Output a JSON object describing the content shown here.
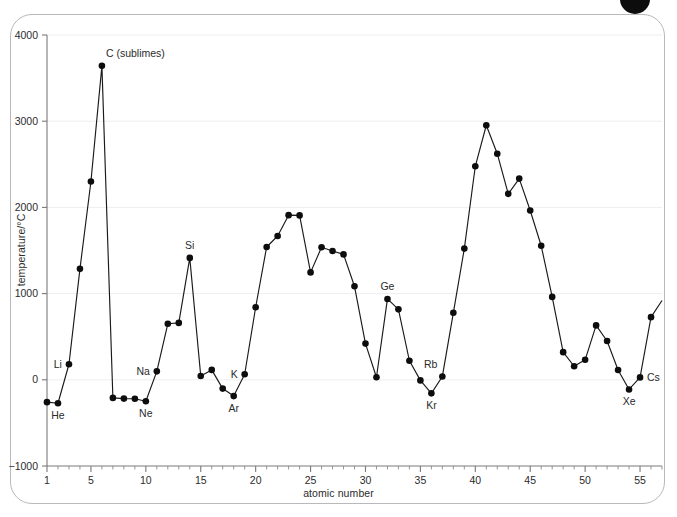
{
  "figure": {
    "frame_border_color": "#b9b9bb",
    "background_color": "#ffffff",
    "badge_color": "#0d0d0d",
    "badge_name": "page-corner-badge"
  },
  "chart_data": {
    "type": "line",
    "title": "",
    "subtitle": "",
    "xlabel": "atomic number",
    "ylabel": "temperature/°C",
    "xlim": [
      1,
      57
    ],
    "ylim": [
      -1000,
      4000
    ],
    "xticks": [
      1,
      5,
      10,
      15,
      20,
      25,
      30,
      35,
      40,
      45,
      50,
      55
    ],
    "xtick_labels": [
      "1",
      "5",
      "10",
      "15",
      "20",
      "25",
      "30",
      "35",
      "40",
      "45",
      "50",
      "55"
    ],
    "x_minor_tick_step": 1,
    "yticks": [
      -1000,
      0,
      1000,
      2000,
      3000,
      4000
    ],
    "ytick_labels": [
      "−1000",
      "0",
      "1000",
      "2000",
      "3000",
      "4000"
    ],
    "grid": "horizontal-major-only",
    "grid_color": "#eeeeee",
    "legend": "none",
    "line_color": "#1a1a1a",
    "marker_color": "#0d0d0d",
    "marker": "circle",
    "series": [
      {
        "name": "melting point",
        "x": [
          1,
          2,
          3,
          4,
          5,
          6,
          7,
          8,
          9,
          10,
          11,
          12,
          13,
          14,
          15,
          16,
          17,
          18,
          19,
          20,
          21,
          22,
          23,
          24,
          25,
          26,
          27,
          28,
          29,
          30,
          31,
          32,
          33,
          34,
          35,
          36,
          37,
          38,
          39,
          40,
          41,
          42,
          43,
          44,
          45,
          46,
          47,
          48,
          49,
          50,
          51,
          52,
          53,
          54,
          55,
          56,
          57
        ],
        "values": [
          -259,
          -272,
          180,
          1287,
          2300,
          3642,
          -210,
          -218,
          -220,
          -249,
          98,
          650,
          660,
          1414,
          44,
          115,
          -102,
          -189,
          64,
          842,
          1541,
          1668,
          1910,
          1907,
          1246,
          1538,
          1495,
          1455,
          1085,
          420,
          30,
          938,
          817,
          221,
          -7,
          -157,
          39,
          777,
          1522,
          2477,
          2953,
          2623,
          2157,
          2334,
          1964,
          1555,
          962,
          321,
          157,
          232,
          631,
          450,
          114,
          -112,
          28,
          727,
          920
        ]
      }
    ],
    "annotations": [
      {
        "label": "He",
        "x": 2,
        "y": -272,
        "position": "below"
      },
      {
        "label": "Li",
        "x": 3,
        "y": 180,
        "position": "left"
      },
      {
        "label": "C (sublimes)",
        "x": 6,
        "y": 3642,
        "position": "above-right"
      },
      {
        "label": "Ne",
        "x": 10,
        "y": -249,
        "position": "below"
      },
      {
        "label": "Na",
        "x": 11,
        "y": 98,
        "position": "left"
      },
      {
        "label": "Si",
        "x": 14,
        "y": 1414,
        "position": "above"
      },
      {
        "label": "Ar",
        "x": 18,
        "y": -189,
        "position": "below"
      },
      {
        "label": "K",
        "x": 19,
        "y": 64,
        "position": "left"
      },
      {
        "label": "Ge",
        "x": 32,
        "y": 938,
        "position": "above"
      },
      {
        "label": "Kr",
        "x": 36,
        "y": -157,
        "position": "below"
      },
      {
        "label": "Rb",
        "x": 37,
        "y": 39,
        "position": "above-left"
      },
      {
        "label": "Xe",
        "x": 54,
        "y": -112,
        "position": "below"
      },
      {
        "label": "Cs",
        "x": 55,
        "y": 28,
        "position": "right"
      }
    ]
  }
}
